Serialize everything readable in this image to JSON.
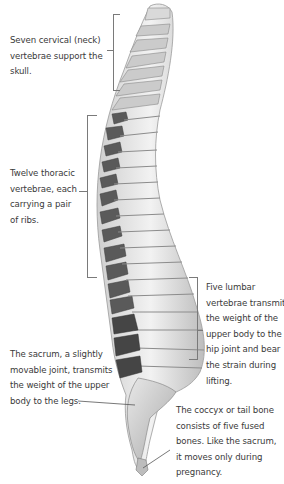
{
  "diagram": {
    "annotations": [
      {
        "id": "cervical",
        "text": "Seven cervical (neck) vertebrae support the skull.",
        "lines": [
          "Seven cervical (neck)",
          "vertebrae support the",
          "skull."
        ]
      },
      {
        "id": "thoracic",
        "text": "Twelve thoracic vertebrae, each carrying a pair of ribs.",
        "lines": [
          "Twelve thoracic",
          "vertebrae, each",
          "carrying a pair",
          "of ribs."
        ]
      },
      {
        "id": "lumbar",
        "text": "Five lumbar vertebrae transmit the weight of the upper body to the hip joint and bear the strain during lifting.",
        "lines": [
          "Five lumbar",
          "vertebrae transmit",
          "the weight of the",
          "upper body to the",
          "hip joint and bear",
          "the strain during",
          "lifting."
        ]
      },
      {
        "id": "sacrum",
        "text": "The sacrum, a slightly movable joint, transmits the weight of the upper body to the legs.",
        "lines": [
          "The sacrum, a slightly",
          "movable joint, transmits",
          "the weight of the upper",
          "body to the legs."
        ]
      },
      {
        "id": "coccyx",
        "text": "The coccyx or tail bone consists of five fused bones. Like the sacrum, it moves only during pregnancy.",
        "lines": [
          "The coccyx or tail bone",
          "consists of five fused",
          "bones. Like the sacrum,",
          "it moves only during",
          "pregnancy."
        ]
      }
    ],
    "colors": {
      "text": "#3a3a3a",
      "bracket": "#7a7a7a",
      "bone_light": "#e6e6e6",
      "bone_mid": "#b4b4b4",
      "bone_dark": "#4a4a4a"
    }
  }
}
